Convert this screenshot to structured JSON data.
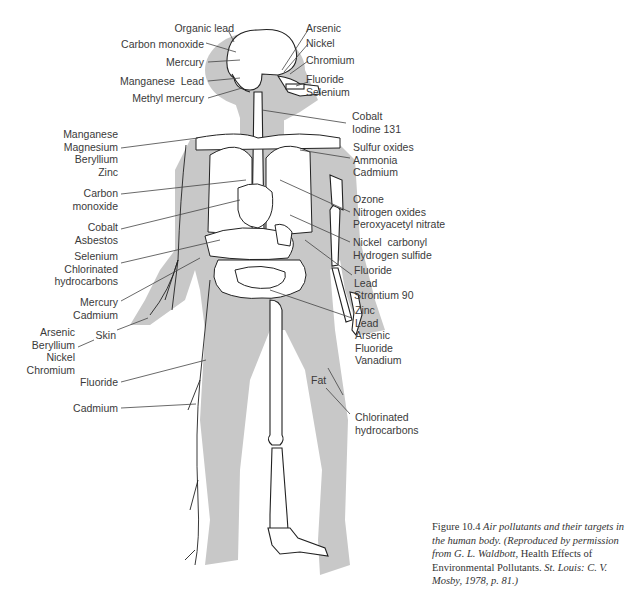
{
  "figure": {
    "number": "Figure 10.4",
    "title": "Air pollutants and their targets in the human body.",
    "credit_prefix": "(Reproduced by permission from G. L. Waldbott,",
    "credit_book": "Health Effects of Environmental Pollutants.",
    "credit_suffix": "St. Louis: C. V. Mosby, 1978, p. 81.)"
  },
  "labels_left": [
    {
      "id": "organic-lead",
      "text": "Organic lead"
    },
    {
      "id": "carbon-monoxide-brain",
      "text": "Carbon monoxide"
    },
    {
      "id": "mercury-brain",
      "text": "Mercury"
    },
    {
      "id": "manganese-lead",
      "text": "Manganese  Lead"
    },
    {
      "id": "methyl-mercury",
      "text": "Methyl mercury"
    },
    {
      "id": "blood-metals",
      "text": "Manganese\nMagnesium\nBeryllium\nZinc"
    },
    {
      "id": "carbon-monoxide-heart",
      "text": "Carbon\nmonoxide"
    },
    {
      "id": "cobalt-asbestos",
      "text": "Cobalt\nAsbestos"
    },
    {
      "id": "selenium-chlorinated",
      "text": "Selenium\nChlorinated\nhydrocarbons"
    },
    {
      "id": "mercury-cadmium",
      "text": "Mercury\nCadmium"
    },
    {
      "id": "skin",
      "text": "Skin"
    },
    {
      "id": "skin-metals",
      "text": "Arsenic\nBeryllium\nNickel\nChromium"
    },
    {
      "id": "fluoride-left",
      "text": "Fluoride"
    },
    {
      "id": "cadmium-left",
      "text": "Cadmium"
    }
  ],
  "labels_right": [
    {
      "id": "arsenic-nose",
      "text": "Arsenic"
    },
    {
      "id": "nickel-nose",
      "text": "Nickel"
    },
    {
      "id": "chromium-nose",
      "text": "Chromium"
    },
    {
      "id": "fluoride-selenium",
      "text": "Fluoride\nSelenium"
    },
    {
      "id": "cobalt-iodine",
      "text": "Cobalt\nIodine 131"
    },
    {
      "id": "sulfur-ammonia-cadmium",
      "text": "Sulfur oxides\nAmmonia\nCadmium"
    },
    {
      "id": "ozone-group",
      "text": "Ozone\nNitrogen oxides\nPeroxyacetyl nitrate"
    },
    {
      "id": "nickel-carbonyl",
      "text": "Nickel  carbonyl\nHydrogen sulfide"
    },
    {
      "id": "bone-group",
      "text": "Fluoride\nLead\nStrontium 90"
    },
    {
      "id": "kidney-group",
      "text": "Zinc\nLead\nArsenic\nFluoride\nVanadium"
    },
    {
      "id": "fat",
      "text": "Fat"
    },
    {
      "id": "chlorinated-fat",
      "text": "Chlorinated\nhydrocarbons"
    }
  ],
  "colors": {
    "silhouette": "#c8c8c8",
    "outline": "#222222",
    "organ_fill": "#ffffff",
    "text": "#3a3a3a"
  }
}
